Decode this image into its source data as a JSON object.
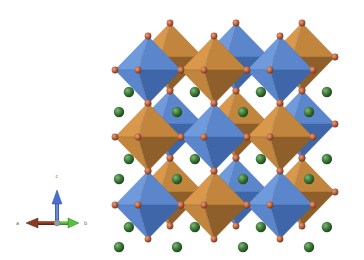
{
  "figure": {
    "background": "#ffffff"
  },
  "axes": {
    "labels": {
      "a": "a",
      "b": "b",
      "c": "c"
    },
    "colors": {
      "a": "#8a3b24",
      "b": "#58c040",
      "c": "#4a6fd0"
    }
  },
  "colors": {
    "blue_light": "#6f9bdc",
    "blue_mid": "#5b86cc",
    "blue_dark": "#3f66a8",
    "orange_light": "#d9984a",
    "orange_mid": "#c2853d",
    "orange_dark": "#8e5f2a",
    "anion": "#b8603e",
    "cation": "#3f7a3a"
  },
  "lattice": {
    "front": {
      "cols_x": [
        148,
        214,
        280
      ],
      "rows_y": [
        70,
        137,
        205
      ],
      "half_width": 33,
      "half_height": 34,
      "depth_dx": 10,
      "depth_dy": -2
    },
    "back_offset": {
      "dx": 22,
      "dy": -13
    },
    "pattern": [
      [
        "blue",
        "orange",
        "blue"
      ],
      [
        "orange",
        "blue",
        "orange"
      ],
      [
        "blue",
        "orange",
        "blue"
      ]
    ]
  }
}
